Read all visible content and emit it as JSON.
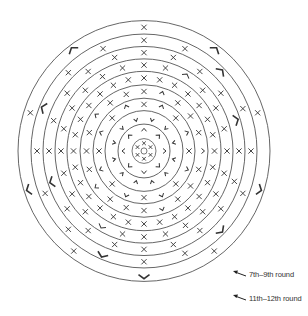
{
  "diagram": {
    "center": {
      "x": 144,
      "y": 151
    },
    "scale_y": 1.035,
    "line_color": "#555555",
    "mark_color": "#333333",
    "ring_radii": [
      126,
      113,
      101,
      89,
      77,
      64,
      51,
      39,
      26,
      12,
      3
    ],
    "rings": [
      {
        "r": 119.5,
        "count": 10,
        "offset": -90,
        "pattern": "XCXCXCXCXC"
      },
      {
        "r": 107,
        "count": 16,
        "offset": -90,
        "pattern": "XXCXXXCXXCXXXCXX"
      },
      {
        "r": 95,
        "count": 20,
        "offset": -90,
        "pattern": "XXXXCXXXXXXXXXCXXXXX"
      },
      {
        "r": 83,
        "count": 24,
        "offset": -90,
        "pattern": "XXCXXXXXXXXXXXCXXXXXXXXX"
      },
      {
        "r": 70.5,
        "count": 28,
        "offset": -90,
        "pattern": "XXXXXXXXXXXXXXXXXXXXXXXXXXXX"
      },
      {
        "r": 57.5,
        "count": 20,
        "offset": -90,
        "pattern": "XCXXXCXXXCXXXCXXXCXX"
      },
      {
        "r": 45,
        "count": 16,
        "offset": -90,
        "pattern": "XCXCXCXCXCXCXCXC"
      },
      {
        "r": 32.5,
        "count": 12,
        "offset": -75,
        "pattern": "VVVVVVVVVVVV"
      },
      {
        "r": 19,
        "count": 8,
        "offset": -90,
        "pattern": "CCCCCCCC"
      },
      {
        "r": 7.5,
        "count": 6,
        "offset": -90,
        "pattern": "XXXXXX"
      }
    ]
  },
  "legend": [
    {
      "label": "7th–9th round",
      "y": 274
    },
    {
      "label": "11th–12th round",
      "y": 298
    }
  ]
}
